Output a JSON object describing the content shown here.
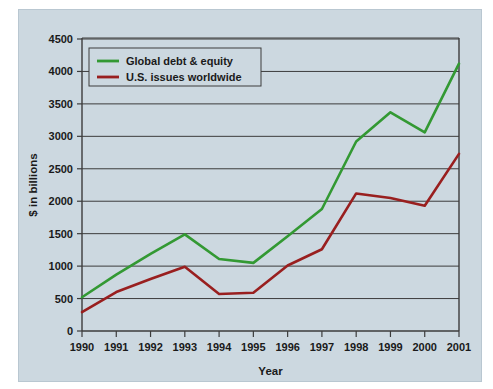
{
  "chart_data": {
    "type": "line",
    "title": "",
    "xlabel": "Year",
    "ylabel": "$ in billions",
    "categories": [
      "1990",
      "1991",
      "1992",
      "1993",
      "1994",
      "1995",
      "1996",
      "1997",
      "1998",
      "1999",
      "2000",
      "2001"
    ],
    "x": [
      1990,
      1991,
      1992,
      1993,
      1994,
      1995,
      1996,
      1997,
      1998,
      1999,
      2000,
      2001
    ],
    "xlim": [
      1990,
      2001
    ],
    "ylim": [
      0,
      4500
    ],
    "ytick_labels": [
      "0",
      "500",
      "1000",
      "1500",
      "2000",
      "2500",
      "3000",
      "3500",
      "4000",
      "4500"
    ],
    "yticks": [
      0,
      500,
      1000,
      1500,
      2000,
      2500,
      3000,
      3500,
      4000,
      4500
    ],
    "grid": true,
    "legend_position": "upper-left",
    "series": [
      {
        "name": "Global debt & equity",
        "color": "#339933",
        "values": [
          520,
          870,
          1190,
          1490,
          1110,
          1050,
          1460,
          1880,
          2920,
          3370,
          3060,
          4120
        ]
      },
      {
        "name": "U.S. issues worldwide",
        "color": "#991f1f",
        "values": [
          290,
          600,
          800,
          990,
          570,
          590,
          1010,
          1260,
          2120,
          2050,
          1930,
          2730
        ]
      }
    ]
  },
  "legend": {
    "entries": [
      {
        "label": "Global debt & equity",
        "color": "#339933"
      },
      {
        "label": "U.S. issues worldwide",
        "color": "#991f1f"
      }
    ]
  },
  "axes": {
    "x_axis_title": "Year",
    "y_axis_title": "$ in billions"
  },
  "colors": {
    "panel_background": "#ccd8e0",
    "page_background": "#ffffff",
    "axis": "#3c3c3c",
    "text": "#1a1a1a",
    "series_green": "#339933",
    "series_red": "#991f1f"
  }
}
